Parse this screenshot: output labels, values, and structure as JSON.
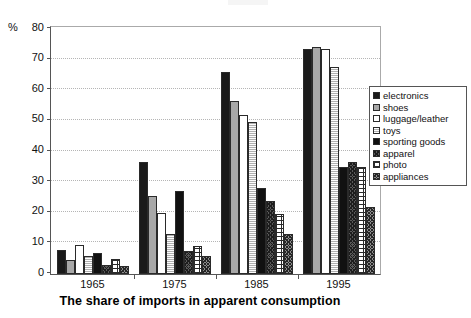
{
  "chart_data": {
    "type": "bar",
    "title": "The share of imports in apparent consumption",
    "xlabel": "",
    "ylabel": "%",
    "ylim": [
      0,
      80
    ],
    "yticks": [
      0,
      10,
      20,
      30,
      40,
      50,
      60,
      70,
      80
    ],
    "grid": true,
    "legend_position": "right",
    "categories": [
      "1965",
      "1975",
      "1985",
      "1995"
    ],
    "series": [
      {
        "name": "electronics",
        "pattern": "solid-black",
        "values": [
          8,
          36.5,
          66,
          73.5
        ]
      },
      {
        "name": "shoes",
        "pattern": "solid-gray",
        "values": [
          4.5,
          25.5,
          56.5,
          74
        ]
      },
      {
        "name": "luggage/leather",
        "pattern": "solid-white",
        "values": [
          9.5,
          20,
          52,
          73.5
        ]
      },
      {
        "name": "toys",
        "pattern": "horizontal-lines",
        "values": [
          6,
          13,
          49.5,
          67.5
        ]
      },
      {
        "name": "sporting goods",
        "pattern": "solid-black",
        "values": [
          7,
          27,
          28,
          35
        ]
      },
      {
        "name": "apparel",
        "pattern": "dark-crosshatch",
        "values": [
          3,
          7.5,
          24,
          36.5
        ]
      },
      {
        "name": "photo",
        "pattern": "dotted-white",
        "values": [
          5,
          9,
          19.5,
          35
        ]
      },
      {
        "name": "appliances",
        "pattern": "gray-crosshatch",
        "values": [
          2.5,
          6,
          13,
          22
        ]
      }
    ]
  },
  "axis": {
    "percent_symbol": "%",
    "ytick_labels": [
      "80",
      "70",
      "60",
      "50",
      "40",
      "30",
      "20",
      "10",
      "0"
    ],
    "xtick_labels": [
      "1965",
      "1975",
      "1985",
      "1995"
    ]
  },
  "legend": {
    "items": [
      {
        "label": "electronics"
      },
      {
        "label": "shoes"
      },
      {
        "label": "luggage/leather"
      },
      {
        "label": "toys"
      },
      {
        "label": "sporting goods"
      },
      {
        "label": "apparel"
      },
      {
        "label": "photo"
      },
      {
        "label": "appliances"
      }
    ]
  },
  "colors": {
    "electronics": "#1a1a1a",
    "shoes": "#a8a8a8",
    "luggage": "#ffffff",
    "toys": "#cfcfcf",
    "sporting": "#111111",
    "apparel": "#5a5a5a",
    "photo": "#ffffff",
    "appliances": "#8d8d8d",
    "grid": "#b5b5b5",
    "axis": "#555555"
  }
}
